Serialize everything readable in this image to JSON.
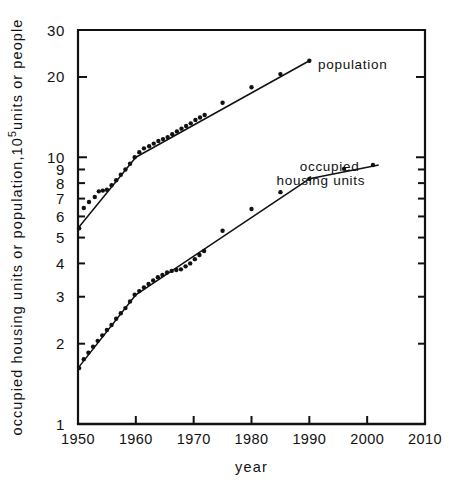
{
  "chart_data": {
    "type": "line",
    "title": "",
    "xlabel": "year",
    "ylabel": "occupied housing units or population, 10⁵ units or people",
    "ylabel_parts": {
      "pre": "occupied housing units or population,10",
      "sup": "5",
      "post": "units or people"
    },
    "scale": {
      "x": "linear",
      "y": "log"
    },
    "xlim": [
      1950,
      2010
    ],
    "ylim": [
      1,
      30
    ],
    "xticks": [
      1950,
      1960,
      1970,
      1980,
      1990,
      2000,
      2010
    ],
    "xticklabels": [
      "1950",
      "1960",
      "1970",
      "1980",
      "1990",
      "2000",
      "2010"
    ],
    "yticks": [
      1,
      2,
      3,
      4,
      5,
      6,
      7,
      8,
      9,
      10,
      20,
      30
    ],
    "yticklabels": [
      "1",
      "2",
      "3",
      "4",
      "5",
      "6",
      "7",
      "8",
      "9",
      "10",
      "20",
      "30"
    ],
    "grid": false,
    "legend_position": "inline-annotation",
    "annotations": [
      {
        "name": "population-label",
        "text": "population",
        "x": 1997.5,
        "y": 21.5
      },
      {
        "name": "housing-label-line1",
        "text": "occupied",
        "x": 1993.5,
        "y": 8.9
      },
      {
        "name": "housing-label-line2",
        "text": "housing units",
        "x": 1992.0,
        "y": 7.9
      }
    ],
    "series": [
      {
        "name": "population",
        "marker": "filled-circle",
        "points": [
          [
            1950.2,
            5.42
          ],
          [
            1951.0,
            6.45
          ],
          [
            1951.9,
            6.8
          ],
          [
            1952.9,
            7.1
          ],
          [
            1953.6,
            7.45
          ],
          [
            1954.3,
            7.5
          ],
          [
            1955.0,
            7.55
          ],
          [
            1955.8,
            7.85
          ],
          [
            1956.6,
            8.2
          ],
          [
            1957.4,
            8.6
          ],
          [
            1958.2,
            9.0
          ],
          [
            1959.0,
            9.45
          ],
          [
            1959.8,
            10.0
          ],
          [
            1960.6,
            10.45
          ],
          [
            1961.4,
            10.8
          ],
          [
            1962.3,
            11.0
          ],
          [
            1963.1,
            11.25
          ],
          [
            1963.9,
            11.5
          ],
          [
            1964.7,
            11.7
          ],
          [
            1965.5,
            11.9
          ],
          [
            1966.3,
            12.2
          ],
          [
            1967.1,
            12.5
          ],
          [
            1967.9,
            12.8
          ],
          [
            1968.7,
            13.1
          ],
          [
            1969.5,
            13.4
          ],
          [
            1970.3,
            13.8
          ],
          [
            1971.1,
            14.1
          ],
          [
            1971.9,
            14.4
          ],
          [
            1975.0,
            16.0
          ],
          [
            1980.0,
            18.3
          ],
          [
            1985.0,
            20.5
          ],
          [
            1990.0,
            23.0
          ]
        ],
        "fit_line": {
          "type": "piecewise",
          "breakpoints": [
            1950,
            1960,
            1990
          ]
        }
      },
      {
        "name": "occupied housing units",
        "marker": "filled-circle",
        "points": [
          [
            1950.2,
            1.62
          ],
          [
            1951.0,
            1.75
          ],
          [
            1951.8,
            1.85
          ],
          [
            1952.6,
            1.95
          ],
          [
            1953.4,
            2.05
          ],
          [
            1954.2,
            2.15
          ],
          [
            1955.0,
            2.25
          ],
          [
            1955.8,
            2.35
          ],
          [
            1956.6,
            2.48
          ],
          [
            1957.4,
            2.6
          ],
          [
            1958.2,
            2.72
          ],
          [
            1959.0,
            2.88
          ],
          [
            1959.8,
            3.05
          ],
          [
            1960.6,
            3.15
          ],
          [
            1961.4,
            3.25
          ],
          [
            1962.2,
            3.35
          ],
          [
            1963.0,
            3.45
          ],
          [
            1963.8,
            3.55
          ],
          [
            1964.6,
            3.62
          ],
          [
            1965.4,
            3.7
          ],
          [
            1966.2,
            3.75
          ],
          [
            1967.0,
            3.78
          ],
          [
            1967.8,
            3.8
          ],
          [
            1968.6,
            3.9
          ],
          [
            1969.4,
            4.0
          ],
          [
            1970.2,
            4.15
          ],
          [
            1971.0,
            4.3
          ],
          [
            1971.8,
            4.45
          ],
          [
            1975.0,
            5.3
          ],
          [
            1980.0,
            6.4
          ],
          [
            1985.0,
            7.4
          ],
          [
            1990.0,
            8.3
          ],
          [
            1996.0,
            9.05
          ],
          [
            2001.0,
            9.35
          ]
        ],
        "fit_line": {
          "type": "piecewise",
          "breakpoints": [
            1950,
            1960,
            1990,
            2002
          ]
        }
      }
    ],
    "colors": {
      "line": "#111111",
      "marker": "#111111",
      "axis": "#111111",
      "background": "#ffffff"
    }
  }
}
